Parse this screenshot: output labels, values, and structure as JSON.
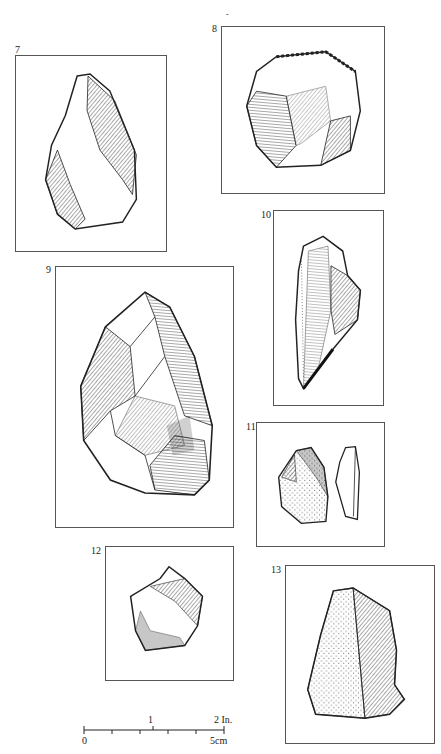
{
  "page": {
    "background": "#ffffff",
    "stray_mark": "-"
  },
  "figures": [
    {
      "number": "7",
      "description": "flake tool with retouched edges"
    },
    {
      "number": "8",
      "description": "flake core / scraper"
    },
    {
      "number": "9",
      "description": "bifacial hand axe"
    },
    {
      "number": "10",
      "description": "elongated blade point"
    },
    {
      "number": "11",
      "description": "small flake with cortex, shown with side profile"
    },
    {
      "number": "12",
      "description": "small pentagonal flake"
    },
    {
      "number": "13",
      "description": "triangular flake with stippled cortex face"
    }
  ],
  "scale_bar": {
    "inch_labels": [
      "1",
      "2 In."
    ],
    "cm_labels": [
      "0",
      "5cm"
    ],
    "ticks": 6
  }
}
